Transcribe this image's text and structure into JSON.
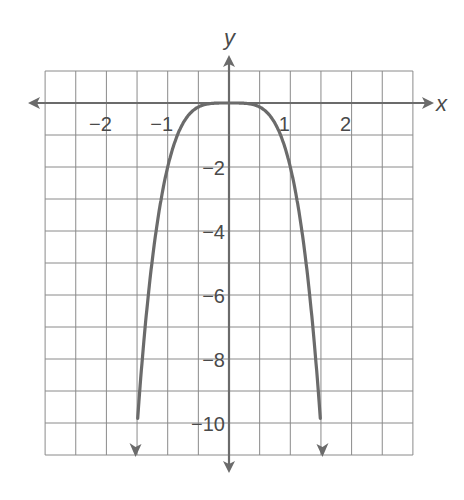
{
  "chart_data": {
    "type": "line",
    "title": "",
    "xlabel": "x",
    "ylabel": "y",
    "xlim": [
      -3,
      3
    ],
    "ylim": [
      -11,
      1
    ],
    "grid": true,
    "grid_step_x": 0.5,
    "grid_step_y": 1,
    "x_ticks": [
      -2,
      -1,
      1,
      2
    ],
    "x_tick_labels": [
      "−2",
      "−1",
      "1",
      "2"
    ],
    "y_ticks": [
      -2,
      -4,
      -6,
      -8,
      -10
    ],
    "y_tick_labels": [
      "−2",
      "−4",
      "−6",
      "−8",
      "−10"
    ],
    "series": [
      {
        "name": "y = -2x^4",
        "x": [
          -1.52,
          -1.5,
          -1.25,
          -1,
          -0.75,
          -0.5,
          -0.25,
          0,
          0.25,
          0.5,
          0.75,
          1,
          1.25,
          1.5,
          1.52
        ],
        "y": [
          -10.67,
          -10.13,
          -4.88,
          -2,
          -0.63,
          -0.13,
          -0.01,
          0,
          -0.01,
          -0.13,
          -0.63,
          -2,
          -4.88,
          -10.13,
          -10.67
        ],
        "color": "#6b6b6b",
        "arrows": "both-ends"
      }
    ],
    "axis_color": "#6b6b6b",
    "grid_color": "#8a8a8a"
  }
}
